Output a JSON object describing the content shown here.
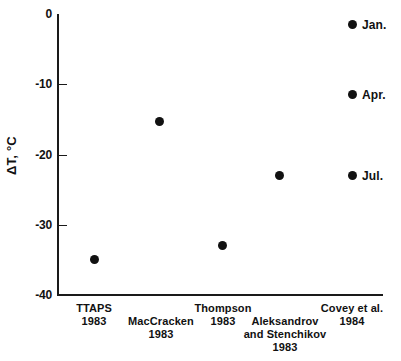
{
  "chart_data": {
    "type": "scatter",
    "title": "",
    "xlabel": "",
    "ylabel": "ΔT, °C",
    "ylim": [
      -40,
      0
    ],
    "yticks": [
      0,
      -10,
      -20,
      -30,
      -40
    ],
    "ytick_labels": [
      "0",
      "-10",
      "-20",
      "-30",
      "-40"
    ],
    "grid": false,
    "legend": "none",
    "categories": [
      "TTAPS 1983",
      "MacCracken 1983",
      "Thompson 1983",
      "Aleksandrov and Stenchikov 1983",
      "Covey et al. 1984"
    ],
    "values": [
      -35,
      -15.3,
      -33,
      -23,
      -1.5
    ],
    "points": [
      {
        "category": "TTAPS 1983",
        "value": -35,
        "label": ""
      },
      {
        "category": "MacCracken 1983",
        "value": -15.3,
        "label": ""
      },
      {
        "category": "Thompson 1983",
        "value": -33,
        "label": ""
      },
      {
        "category": "Aleksandrov and Stenchikov 1983",
        "value": -23,
        "label": ""
      },
      {
        "category": "Covey et al. 1984",
        "value": -1.5,
        "label": "Jan."
      },
      {
        "category": "Covey et al. 1984",
        "value": -11.5,
        "label": "Apr."
      },
      {
        "category": "Covey et al. 1984",
        "value": -23,
        "label": "Jul."
      }
    ]
  },
  "axis": {
    "y_title": "ΔT, °C",
    "ticks": [
      {
        "label": "0",
        "value": 0
      },
      {
        "label": "-10",
        "value": -10
      },
      {
        "label": "-20",
        "value": -20
      },
      {
        "label": "-30",
        "value": -30
      },
      {
        "label": "-40",
        "value": -40
      }
    ]
  },
  "x_categories": [
    {
      "name": "TTAPS",
      "year": "1983"
    },
    {
      "name": "MacCracken",
      "year": "1983"
    },
    {
      "name": "Thompson",
      "year": "1983"
    },
    {
      "name": "Aleksandrov",
      "name2": "and Stenchikov",
      "year": "1983"
    },
    {
      "name": "Covey et al.",
      "year": "1984"
    }
  ],
  "series_points": [
    {
      "name": "ttaps",
      "value": -35,
      "label": ""
    },
    {
      "name": "maccracken",
      "value": -15.3,
      "label": ""
    },
    {
      "name": "thompson",
      "value": -33,
      "label": ""
    },
    {
      "name": "aleksandrov",
      "value": -23,
      "label": ""
    },
    {
      "name": "covey-jan",
      "value": -1.5,
      "label": "Jan."
    },
    {
      "name": "covey-apr",
      "value": -11.5,
      "label": "Apr."
    },
    {
      "name": "covey-jul",
      "value": -23,
      "label": "Jul."
    }
  ]
}
